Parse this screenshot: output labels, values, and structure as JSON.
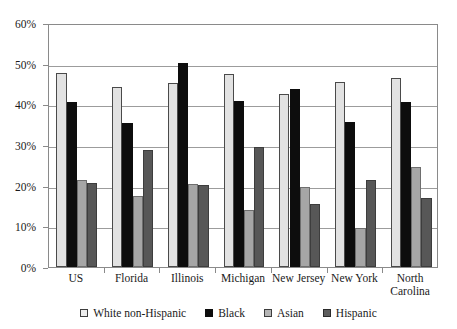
{
  "chart_data": {
    "type": "bar",
    "title": "",
    "subtitle": "",
    "xlabel": "",
    "ylabel": "",
    "ylim": [
      0,
      60
    ],
    "ytick_labels": [
      "0%",
      "10%",
      "20%",
      "30%",
      "40%",
      "50%",
      "60%"
    ],
    "ytick_values": [
      0,
      10,
      20,
      30,
      40,
      50,
      60
    ],
    "grid": true,
    "legend_position": "bottom",
    "categories": [
      "US",
      "Florida",
      "Illinois",
      "Michigan",
      "New Jersey",
      "New York",
      "North\nCarolina"
    ],
    "series": [
      {
        "name": "White non-Hispanic",
        "color": "#e2e2e2",
        "values": [
          47.7,
          44.3,
          45.2,
          47.5,
          42.5,
          45.6,
          46.5
        ]
      },
      {
        "name": "Black",
        "color": "#0d0d0d",
        "values": [
          40.7,
          35.3,
          50.2,
          40.8,
          43.7,
          35.7,
          40.5
        ]
      },
      {
        "name": "Asian",
        "color": "#a6a6a6",
        "values": [
          21.3,
          17.4,
          20.3,
          14.1,
          19.6,
          9.6,
          24.5
        ]
      },
      {
        "name": "Hispanic",
        "color": "#575757",
        "values": [
          20.6,
          28.8,
          20.2,
          29.6,
          15.5,
          21.5,
          17.0
        ]
      }
    ]
  },
  "legend": {
    "items": [
      {
        "label": "White non-Hispanic",
        "swatch": "white-nh"
      },
      {
        "label": "Black",
        "swatch": "black"
      },
      {
        "label": "Asian",
        "swatch": "asian"
      },
      {
        "label": "Hispanic",
        "swatch": "hispanic"
      }
    ]
  }
}
